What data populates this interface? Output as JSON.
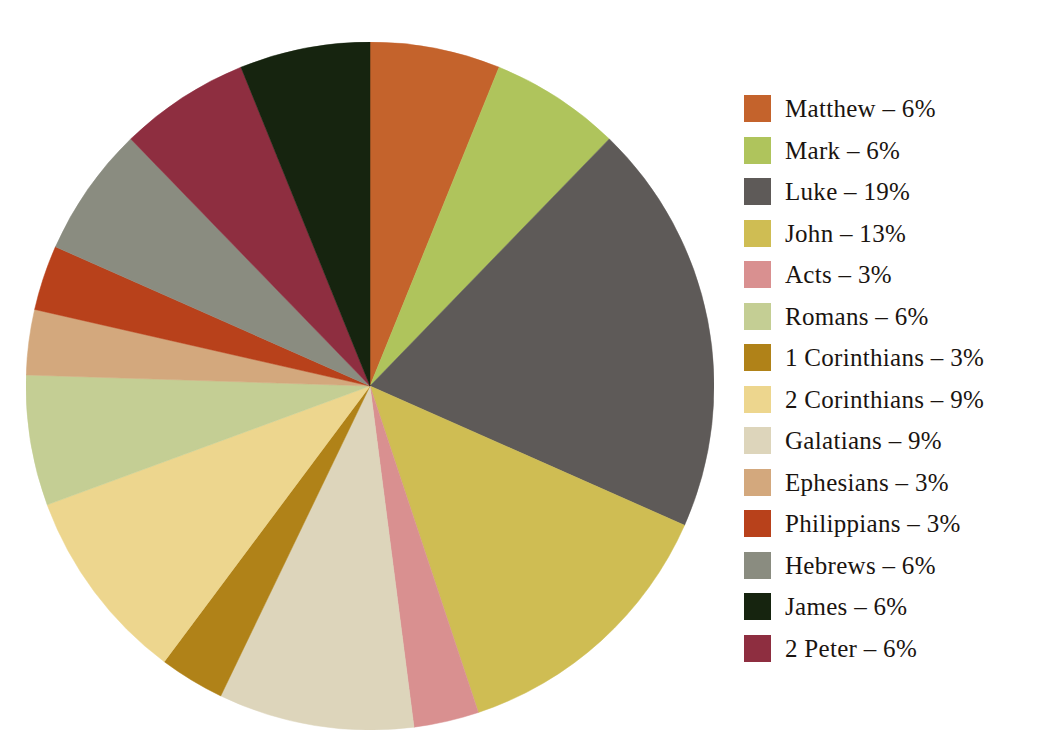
{
  "chart_data": {
    "type": "pie",
    "title": "",
    "subtitle": "",
    "xlabel": "",
    "ylabel": "",
    "legend_position": "right",
    "grid": false,
    "units": "%",
    "start_angle_deg": 0,
    "direction": "clockwise",
    "categories": [
      "Matthew",
      "Mark",
      "Luke",
      "John",
      "Acts",
      "Romans",
      "1 Corinthians",
      "2 Corinthians",
      "Galatians",
      "Ephesians",
      "Philippians",
      "Hebrews",
      "James",
      "2 Peter"
    ],
    "values": [
      6,
      6,
      19,
      13,
      3,
      6,
      3,
      9,
      9,
      3,
      3,
      6,
      6,
      6
    ],
    "colors": [
      "#C4632C",
      "#AFC45C",
      "#5E5A58",
      "#CFBD53",
      "#D99090",
      "#C4CE94",
      "#B08218",
      "#EDD68E",
      "#DDD5BB",
      "#D3A87D",
      "#B8411B",
      "#8A8C80",
      "#16240F",
      "#8E2E40"
    ],
    "slice_order_clockwise": [
      "Matthew",
      "Mark",
      "Luke",
      "John",
      "Acts",
      "Galatians",
      "1 Corinthians",
      "2 Corinthians",
      "Romans",
      "Ephesians",
      "Philippians",
      "Hebrews",
      "2 Peter",
      "James"
    ]
  },
  "legend": {
    "items": [
      {
        "label": "Matthew – 6%",
        "name": "Matthew",
        "value": 6,
        "color": "#C4632C"
      },
      {
        "label": "Mark – 6%",
        "name": "Mark",
        "value": 6,
        "color": "#AFC45C"
      },
      {
        "label": "Luke – 19%",
        "name": "Luke",
        "value": 19,
        "color": "#5E5A58"
      },
      {
        "label": "John – 13%",
        "name": "John",
        "value": 13,
        "color": "#CFBD53"
      },
      {
        "label": "Acts – 3%",
        "name": "Acts",
        "value": 3,
        "color": "#D99090"
      },
      {
        "label": "Romans – 6%",
        "name": "Romans",
        "value": 6,
        "color": "#C4CE94"
      },
      {
        "label": "1 Corinthians – 3%",
        "name": "1 Corinthians",
        "value": 3,
        "color": "#B08218"
      },
      {
        "label": "2 Corinthians – 9%",
        "name": "2 Corinthians",
        "value": 9,
        "color": "#EDD68E"
      },
      {
        "label": "Galatians – 9%",
        "name": "Galatians",
        "value": 9,
        "color": "#DDD5BB"
      },
      {
        "label": "Ephesians – 3%",
        "name": "Ephesians",
        "value": 3,
        "color": "#D3A87D"
      },
      {
        "label": "Philippians – 3%",
        "name": "Philippians",
        "value": 3,
        "color": "#B8411B"
      },
      {
        "label": "Hebrews – 6%",
        "name": "Hebrews",
        "value": 6,
        "color": "#8A8C80"
      },
      {
        "label": "James – 6%",
        "name": "James",
        "value": 6,
        "color": "#16240F"
      },
      {
        "label": "2 Peter – 6%",
        "name": "2 Peter",
        "value": 6,
        "color": "#8E2E40"
      }
    ]
  }
}
